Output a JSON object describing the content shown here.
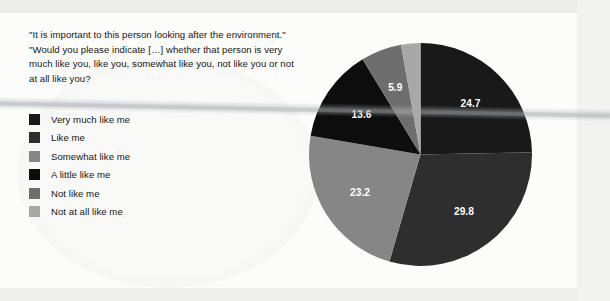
{
  "question": {
    "text": "\"It is important to this person looking after the environment.\" \"Would you please indicate […] whether that person is very much like you, like you, somewhat like you, not like you or not at all like you?"
  },
  "legend": {
    "items": [
      {
        "label": "Very much like me",
        "color": "#191919"
      },
      {
        "label": "Like me",
        "color": "#2e2e2e"
      },
      {
        "label": "Somewhat like me",
        "color": "#868686"
      },
      {
        "label": "A little like me",
        "color": "#0d0d0d"
      },
      {
        "label": "Not like me",
        "color": "#6e6e6e"
      },
      {
        "label": "Not at all like me",
        "color": "#a8a8a8"
      }
    ]
  },
  "chart_data": {
    "type": "pie",
    "title": "",
    "labels": [
      "Very much like me",
      "Like me",
      "Somewhat like me",
      "A little like me",
      "Not like me",
      "Not at all like me"
    ],
    "values": [
      24.7,
      29.8,
      23.2,
      13.6,
      5.9,
      2.8
    ],
    "value_labels": [
      "24.7",
      "29.8",
      "23.2",
      "13.6",
      "5.9",
      "2.8"
    ],
    "colors": [
      "#191919",
      "#2e2e2e",
      "#868686",
      "#0d0d0d",
      "#6e6e6e",
      "#a8a8a8"
    ],
    "units": "percent",
    "start_angle_deg": 0,
    "direction": "clockwise",
    "legend_position": "left",
    "grid": false,
    "label_placement": [
      "inside",
      "inside",
      "inside",
      "inside",
      "inside",
      "outside-top"
    ]
  }
}
